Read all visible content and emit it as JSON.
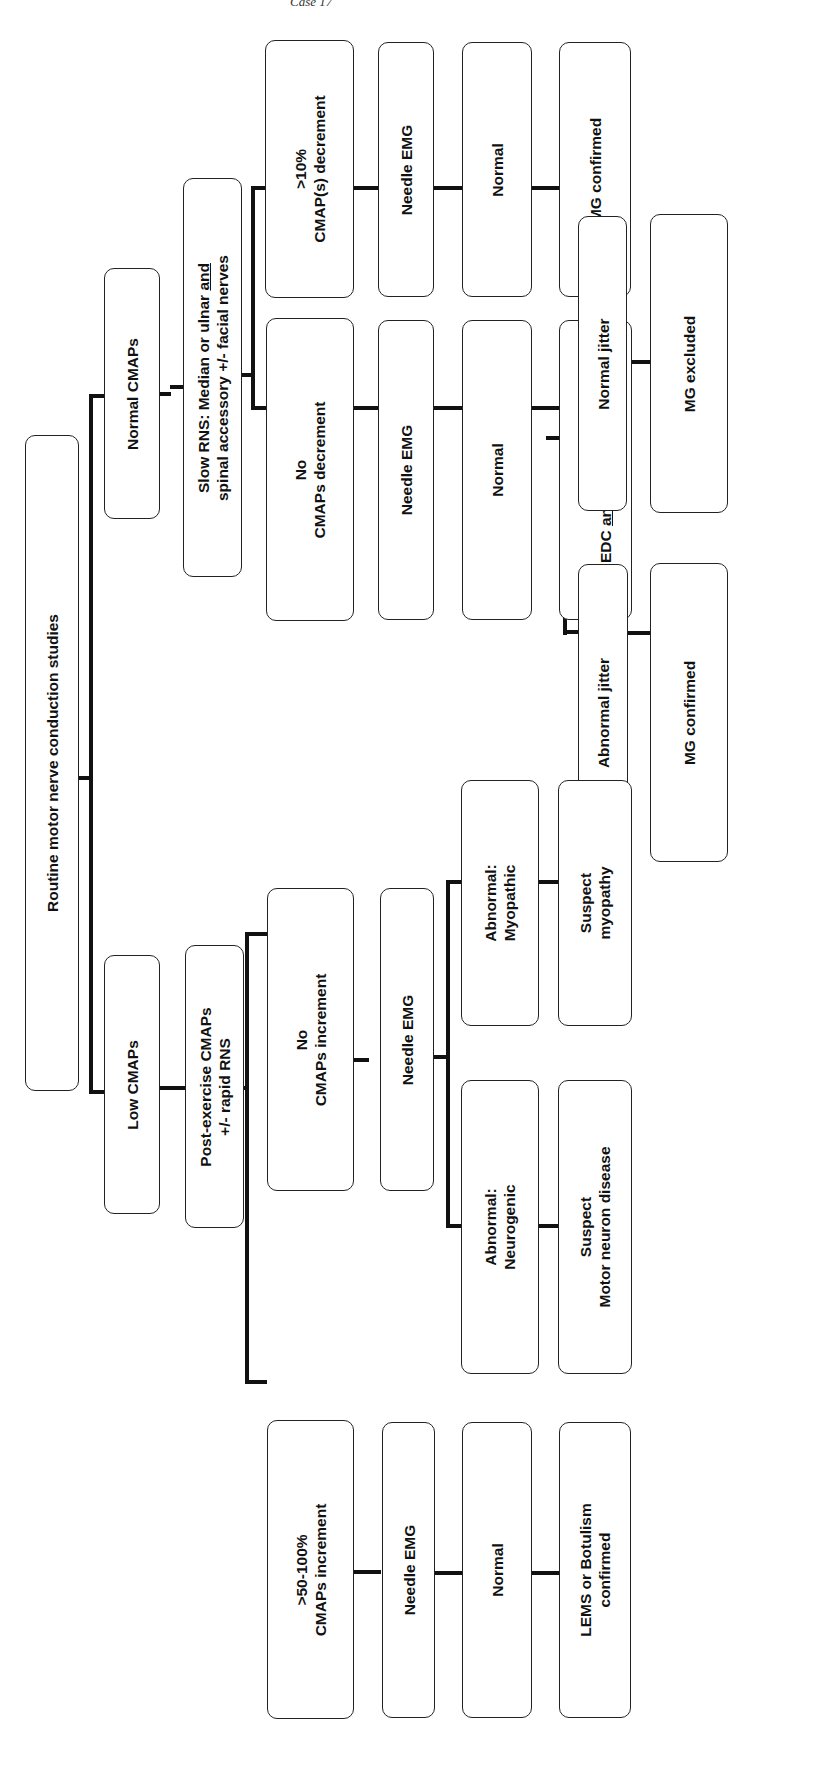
{
  "header": {
    "running_title": "Case 17"
  },
  "flowchart": {
    "root": {
      "lines": [
        "Routine motor nerve conduction studies"
      ]
    },
    "normal_branch": {
      "node": {
        "lines": [
          "Normal CMAPs"
        ]
      },
      "test": {
        "lines": [
          "Slow RNS: Median or ulnar and",
          "spinal accessory +/- facial nerves"
        ]
      },
      "decrement": {
        "result": {
          "lines": [
            ">10%",
            "CMAP(s) decrement"
          ]
        },
        "needle": {
          "lines": [
            "Needle EMG"
          ]
        },
        "emg_result": {
          "lines": [
            "Normal"
          ]
        },
        "conclusion": {
          "lines": [
            "MG confirmed"
          ]
        }
      },
      "no_decrement": {
        "result": {
          "lines": [
            "No",
            "CMAPs decrement"
          ]
        },
        "needle": {
          "lines": [
            "Needle EMG"
          ]
        },
        "emg_result": {
          "lines": [
            "Normal"
          ]
        },
        "sfemg": {
          "lines": [
            "SFEMG:",
            "EDC and/or facial muscle"
          ]
        },
        "normal_jitter": {
          "lines": [
            "Normal jitter"
          ]
        },
        "normal_jitter_conclusion": {
          "lines": [
            "MG excluded"
          ]
        },
        "abnormal_jitter": {
          "lines": [
            "Abnormal jitter"
          ]
        },
        "abnormal_jitter_conclusion": {
          "lines": [
            "MG confirmed"
          ]
        }
      }
    },
    "low_branch": {
      "node": {
        "lines": [
          "Low CMAPs"
        ]
      },
      "test": {
        "lines": [
          "Post-exercise CMAPs",
          "+/- rapid RNS"
        ]
      },
      "no_increment": {
        "result": {
          "lines": [
            "No",
            "CMAPs increment"
          ]
        },
        "needle": {
          "lines": [
            "Needle EMG"
          ]
        },
        "myopathic": {
          "lines": [
            "Abnormal:",
            "Myopathic"
          ]
        },
        "myopathic_conclusion": {
          "lines": [
            "Suspect",
            "myopathy"
          ]
        },
        "neurogenic": {
          "lines": [
            "Abnormal:",
            "Neurogenic"
          ]
        },
        "neurogenic_conclusion": {
          "lines": [
            "Suspect",
            "Motor neuron disease"
          ]
        }
      },
      "increment": {
        "result": {
          "lines": [
            ">50-100%",
            "CMAPs increment"
          ]
        },
        "needle": {
          "lines": [
            "Needle EMG"
          ]
        },
        "emg_result": {
          "lines": [
            "Normal"
          ]
        },
        "conclusion": {
          "lines": [
            "LEMS or Botulism",
            "confirmed"
          ]
        }
      }
    }
  }
}
